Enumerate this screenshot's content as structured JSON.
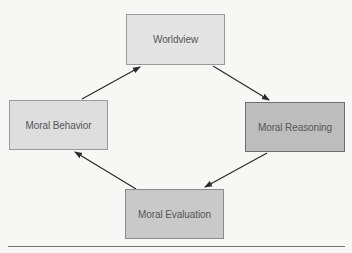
{
  "diagram": {
    "type": "cycle",
    "nodes": [
      {
        "id": "worldview",
        "label": "Worldview",
        "fill": "#e4e4e4",
        "border": "#9a9a9a",
        "x": 126,
        "y": 14,
        "w": 99,
        "h": 51
      },
      {
        "id": "moral-reasoning",
        "label": "Moral Reasoning",
        "fill": "#bdbdbd",
        "border": "#6f6f6f",
        "x": 245,
        "y": 102,
        "w": 100,
        "h": 50
      },
      {
        "id": "moral-evaluation",
        "label": "Moral Evaluation",
        "fill": "#c9c9c9",
        "border": "#8a8a8a",
        "x": 125,
        "y": 189,
        "w": 99,
        "h": 50
      },
      {
        "id": "moral-behavior",
        "label": "Moral Behavior",
        "fill": "#dedede",
        "border": "#9a9a9a",
        "x": 9,
        "y": 100,
        "w": 99,
        "h": 50
      }
    ],
    "edges": [
      {
        "from": "worldview",
        "to": "moral-reasoning"
      },
      {
        "from": "moral-reasoning",
        "to": "moral-evaluation"
      },
      {
        "from": "moral-evaluation",
        "to": "moral-behavior"
      },
      {
        "from": "moral-behavior",
        "to": "worldview"
      }
    ],
    "arrow_color": "#2a2a2a"
  }
}
